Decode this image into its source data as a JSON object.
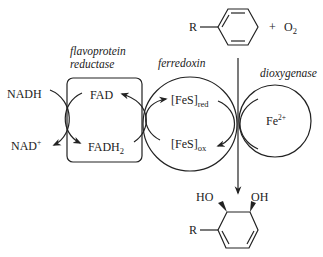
{
  "diagram": {
    "substrate": {
      "r_label": "R",
      "plus": "+",
      "o2_main": "O",
      "o2_sub": "2"
    },
    "reductase": {
      "label_line1": "flavoprotein",
      "label_line2": "reductase",
      "fad": "FAD",
      "fadh2_main": "FADH",
      "fadh2_sub": "2"
    },
    "cofactor": {
      "nadh": "NADH",
      "nad_main": "NAD",
      "nad_sup": "+"
    },
    "ferredoxin": {
      "label": "ferredoxin",
      "fes_red_main": "[FeS]",
      "fes_red_sub": "red",
      "fes_ox_main": "[FeS]",
      "fes_ox_sub": "ox"
    },
    "dioxygenase": {
      "label": "dioxygenase",
      "fe_main": "Fe",
      "fe_sup": "2+"
    },
    "product": {
      "ho_label": "HO",
      "oh_label": "OH",
      "r_label": "R"
    },
    "colors": {
      "ink": "#222222",
      "background": "#ffffff"
    }
  }
}
